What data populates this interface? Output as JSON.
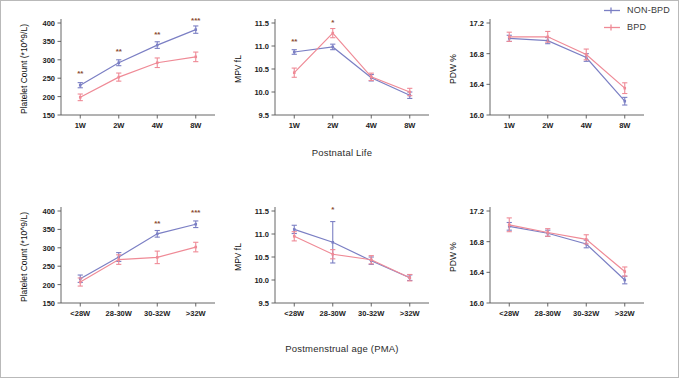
{
  "legend": {
    "items": [
      {
        "label": "NON-BPD",
        "color": "#7b7fc4",
        "marker": "line-marker"
      },
      {
        "label": "BPD",
        "color": "#ef8a96",
        "marker": "line-marker"
      }
    ]
  },
  "colors": {
    "non_bpd": "#7b7fc4",
    "bpd": "#ef8a96",
    "axis": "#555555",
    "tick_text": "#222222",
    "sig_text": "#8a4b33",
    "frame": "#b9b9b9"
  },
  "rows": [
    {
      "x_axis_title": "Postnatal Life"
    },
    {
      "x_axis_title": "Postmenstrual age (PMA)"
    }
  ],
  "chart_data": [
    {
      "id": "platelet-postnatal",
      "type": "line",
      "title": "",
      "xlabel": "Postnatal Life",
      "ylabel": "Platelet Count (*10^9/L)",
      "categories": [
        "1W",
        "2W",
        "4W",
        "8W"
      ],
      "yticks": [
        150,
        200,
        250,
        300,
        350,
        400
      ],
      "ylim": [
        150,
        400
      ],
      "grid": false,
      "legend_position": "figure-top-right",
      "series": [
        {
          "name": "NON-BPD",
          "color": "#7b7fc4",
          "values": [
            231,
            292,
            340,
            382
          ],
          "err": [
            7,
            8,
            9,
            10
          ]
        },
        {
          "name": "BPD",
          "color": "#ef8a96",
          "values": [
            198,
            253,
            292,
            308
          ],
          "err": [
            9,
            11,
            13,
            13
          ]
        }
      ],
      "annotations": [
        {
          "x": "1W",
          "text": "**",
          "y": 256
        },
        {
          "x": "2W",
          "text": "**",
          "y": 315
        },
        {
          "x": "4W",
          "text": "**",
          "y": 362
        },
        {
          "x": "8W",
          "text": "***",
          "y": 401
        }
      ]
    },
    {
      "id": "mpv-postnatal",
      "type": "line",
      "title": "",
      "xlabel": "Postnatal Life",
      "ylabel": "MPV fL",
      "categories": [
        "1W",
        "2W",
        "4W",
        "8W"
      ],
      "yticks": [
        9.5,
        10.0,
        10.5,
        11.0,
        11.5
      ],
      "ylim": [
        9.5,
        11.5
      ],
      "grid": false,
      "legend_position": "figure-top-right",
      "series": [
        {
          "name": "NON-BPD",
          "color": "#7b7fc4",
          "values": [
            10.87,
            10.98,
            10.31,
            9.93
          ],
          "err": [
            0.05,
            0.06,
            0.07,
            0.07
          ]
        },
        {
          "name": "BPD",
          "color": "#ef8a96",
          "values": [
            10.42,
            11.28,
            10.33,
            10.0
          ],
          "err": [
            0.1,
            0.1,
            0.08,
            0.08
          ]
        }
      ],
      "annotations": [
        {
          "x": "1W",
          "text": "**",
          "y": 11.04
        },
        {
          "x": "2W",
          "text": "*",
          "y": 11.45
        }
      ]
    },
    {
      "id": "pdw-postnatal",
      "type": "line",
      "title": "",
      "xlabel": "Postnatal Life",
      "ylabel": "PDW %",
      "categories": [
        "1W",
        "2W",
        "4W",
        "8W"
      ],
      "yticks": [
        16.0,
        16.4,
        16.8,
        17.2
      ],
      "ylim": [
        16.0,
        17.2
      ],
      "grid": false,
      "legend_position": "figure-top-right",
      "series": [
        {
          "name": "NON-BPD",
          "color": "#7b7fc4",
          "values": [
            17.0,
            16.97,
            16.75,
            16.18
          ],
          "err": [
            0.04,
            0.04,
            0.05,
            0.05
          ]
        },
        {
          "name": "BPD",
          "color": "#ef8a96",
          "values": [
            17.02,
            17.02,
            16.79,
            16.35
          ],
          "err": [
            0.06,
            0.07,
            0.07,
            0.07
          ]
        }
      ],
      "annotations": []
    },
    {
      "id": "platelet-pma",
      "type": "line",
      "title": "",
      "xlabel": "Postmenstrual age (PMA)",
      "ylabel": "Platelet Count (*10^9/L)",
      "categories": [
        "<28W",
        "28-30W",
        "30-32W",
        ">32W"
      ],
      "yticks": [
        150,
        200,
        250,
        300,
        350,
        400
      ],
      "ylim": [
        150,
        400
      ],
      "grid": false,
      "legend_position": "figure-top-right",
      "series": [
        {
          "name": "NON-BPD",
          "color": "#7b7fc4",
          "values": [
            216,
            275,
            338,
            364
          ],
          "err": [
            10,
            12,
            9,
            9
          ]
        },
        {
          "name": "BPD",
          "color": "#ef8a96",
          "values": [
            207,
            268,
            274,
            302
          ],
          "err": [
            11,
            13,
            17,
            13
          ]
        }
      ],
      "annotations": [
        {
          "x": "30-32W",
          "text": "**",
          "y": 358
        },
        {
          "x": ">32W",
          "text": "***",
          "y": 388
        }
      ]
    },
    {
      "id": "mpv-pma",
      "type": "line",
      "title": "",
      "xlabel": "Postmenstrual age (PMA)",
      "ylabel": "MPV fL",
      "categories": [
        "<28W",
        "28-30W",
        "30-32W",
        ">32W"
      ],
      "yticks": [
        9.5,
        10.0,
        10.5,
        11.0,
        11.5
      ],
      "ylim": [
        9.5,
        11.5
      ],
      "grid": false,
      "legend_position": "figure-top-right",
      "series": [
        {
          "name": "NON-BPD",
          "color": "#7b7fc4",
          "values": [
            11.1,
            10.82,
            10.42,
            10.05
          ],
          "err": [
            0.09,
            0.45,
            0.08,
            0.06
          ]
        },
        {
          "name": "BPD",
          "color": "#ef8a96",
          "values": [
            10.95,
            10.56,
            10.44,
            10.05
          ],
          "err": [
            0.1,
            0.1,
            0.09,
            0.07
          ]
        }
      ],
      "annotations": [
        {
          "x": "28-30W",
          "text": "*",
          "y": 11.47
        }
      ]
    },
    {
      "id": "pdw-pma",
      "type": "line",
      "title": "",
      "xlabel": "Postmenstrual age (PMA)",
      "ylabel": "PDW %",
      "categories": [
        "<28W",
        "28-30W",
        "30-32W",
        ">32W"
      ],
      "yticks": [
        16.0,
        16.4,
        16.8,
        17.2
      ],
      "ylim": [
        16.0,
        17.2
      ],
      "grid": false,
      "legend_position": "figure-top-right",
      "series": [
        {
          "name": "NON-BPD",
          "color": "#7b7fc4",
          "values": [
            17.0,
            16.91,
            16.77,
            16.3
          ],
          "err": [
            0.05,
            0.04,
            0.05,
            0.05
          ]
        },
        {
          "name": "BPD",
          "color": "#ef8a96",
          "values": [
            17.02,
            16.92,
            16.83,
            16.41
          ],
          "err": [
            0.09,
            0.05,
            0.06,
            0.06
          ]
        }
      ],
      "annotations": []
    }
  ]
}
